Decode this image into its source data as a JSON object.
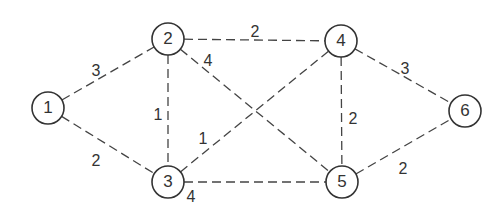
{
  "graph": {
    "nodes": [
      {
        "id": "1",
        "label": "1",
        "x": 48,
        "y": 108
      },
      {
        "id": "2",
        "label": "2",
        "x": 168,
        "y": 39
      },
      {
        "id": "3",
        "label": "3",
        "x": 168,
        "y": 182
      },
      {
        "id": "4",
        "label": "4",
        "x": 341,
        "y": 41
      },
      {
        "id": "5",
        "label": "5",
        "x": 342,
        "y": 182
      },
      {
        "id": "6",
        "label": "6",
        "x": 465,
        "y": 111
      }
    ],
    "edges": [
      {
        "from": "1",
        "to": "2",
        "weight": "3",
        "lx": 96,
        "ly": 72
      },
      {
        "from": "1",
        "to": "3",
        "weight": "2",
        "lx": 96,
        "ly": 162
      },
      {
        "from": "2",
        "to": "3",
        "weight": "1",
        "lx": 158,
        "ly": 116
      },
      {
        "from": "2",
        "to": "4",
        "weight": "2",
        "lx": 255,
        "ly": 33
      },
      {
        "from": "2",
        "to": "5",
        "weight": "4",
        "lx": 208,
        "ly": 62
      },
      {
        "from": "3",
        "to": "4",
        "weight": "1",
        "lx": 203,
        "ly": 140
      },
      {
        "from": "3",
        "to": "5",
        "weight": "4",
        "lx": 191,
        "ly": 198
      },
      {
        "from": "4",
        "to": "5",
        "weight": "2",
        "lx": 353,
        "ly": 120
      },
      {
        "from": "4",
        "to": "6",
        "weight": "3",
        "lx": 405,
        "ly": 70
      },
      {
        "from": "5",
        "to": "6",
        "weight": "2",
        "lx": 403,
        "ly": 170
      }
    ]
  }
}
